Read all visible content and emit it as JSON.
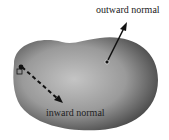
{
  "diagram": {
    "labels": {
      "outward": "outward normal",
      "inward": "inward normal"
    },
    "colors": {
      "body_dark": "#4a4a4a",
      "body_light": "#b8b8b8",
      "arrow": "#111111"
    }
  }
}
